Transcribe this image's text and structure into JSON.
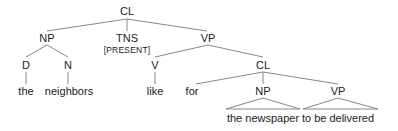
{
  "tree": {
    "nodes": [
      {
        "id": "cl-root",
        "label": "CL",
        "x": 127,
        "y": 11
      },
      {
        "id": "np-subj",
        "label": "NP",
        "x": 47,
        "y": 38
      },
      {
        "id": "tns",
        "label": "TNS",
        "x": 127,
        "y": 38
      },
      {
        "id": "tns-feature",
        "label": "[PRESENT]",
        "x": 127,
        "y": 50
      },
      {
        "id": "vp-main",
        "label": "VP",
        "x": 208,
        "y": 38
      },
      {
        "id": "d",
        "label": "D",
        "x": 26,
        "y": 65
      },
      {
        "id": "n",
        "label": "N",
        "x": 68,
        "y": 65
      },
      {
        "id": "v",
        "label": "V",
        "x": 155,
        "y": 65
      },
      {
        "id": "cl-embedded",
        "label": "CL",
        "x": 263,
        "y": 65
      },
      {
        "id": "word-the",
        "label": "the",
        "x": 26,
        "y": 91
      },
      {
        "id": "word-neighbors",
        "label": "neighbors",
        "x": 69,
        "y": 91
      },
      {
        "id": "word-like",
        "label": "like",
        "x": 155,
        "y": 91
      },
      {
        "id": "word-for",
        "label": "for",
        "x": 192,
        "y": 91
      },
      {
        "id": "np-obj",
        "label": "NP",
        "x": 263,
        "y": 91
      },
      {
        "id": "vp-embedded",
        "label": "VP",
        "x": 338,
        "y": 91
      },
      {
        "id": "phrase-the-newspaper",
        "label": "the newspaper",
        "x": 263,
        "y": 118
      },
      {
        "id": "phrase-to-be-delivered",
        "label": "to be delivered",
        "x": 338,
        "y": 118
      }
    ],
    "edges": [
      [
        127,
        19,
        47,
        31
      ],
      [
        127,
        19,
        127,
        31
      ],
      [
        127,
        19,
        207,
        31
      ],
      [
        47,
        45,
        26,
        57
      ],
      [
        47,
        45,
        68,
        57
      ],
      [
        26,
        72,
        26,
        84
      ],
      [
        68,
        72,
        68,
        84
      ],
      [
        208,
        45,
        155,
        57
      ],
      [
        208,
        45,
        263,
        57
      ],
      [
        155,
        72,
        155,
        84
      ],
      [
        263,
        72,
        196,
        84
      ],
      [
        263,
        72,
        263,
        84
      ],
      [
        263,
        72,
        338,
        84
      ]
    ],
    "triangles": [
      {
        "apex": [
          263,
          98
        ],
        "base": [
          226,
          109,
          300,
          109
        ]
      },
      {
        "apex": [
          338,
          98
        ],
        "base": [
          303,
          109,
          378,
          109
        ]
      }
    ],
    "line_color": "#888888",
    "text_color": "#222222"
  }
}
